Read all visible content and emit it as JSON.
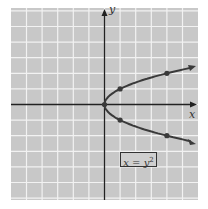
{
  "chart_data": {
    "type": "line",
    "title": "",
    "equation": "x = y",
    "equation_exponent": "2",
    "xlabel": "x",
    "ylabel": "y",
    "xlim": [
      -6,
      6
    ],
    "ylim": [
      -6,
      6
    ],
    "grid": true,
    "series": [
      {
        "name": "x = y^2",
        "points": [
          [
            0,
            0
          ],
          [
            1,
            1
          ],
          [
            1,
            -1
          ],
          [
            4,
            2
          ],
          [
            4,
            -2
          ]
        ]
      }
    ]
  },
  "colors": {
    "grid_bg": "#c8c8c8",
    "grid_line": "#f2f2f2",
    "curve": "#3a3a3a",
    "axis": "#222222"
  }
}
